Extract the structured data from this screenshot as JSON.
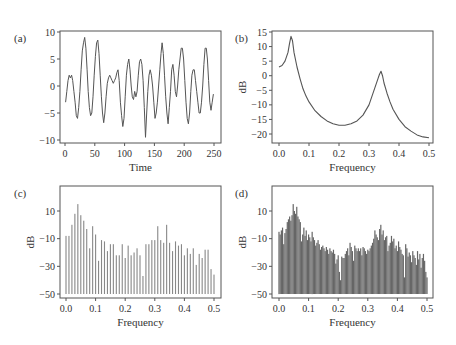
{
  "figure": {
    "panels": [
      "(a)",
      "(b)",
      "(c)",
      "(d)"
    ]
  },
  "chart_data": [
    {
      "id": "a",
      "panel_label": "(a)",
      "type": "line",
      "title": "",
      "xlabel": "Time",
      "ylabel": "",
      "xlim": [
        0,
        250
      ],
      "ylim": [
        -10,
        10
      ],
      "xticks": [
        0,
        50,
        100,
        150,
        200,
        250
      ],
      "yticks": [
        -10,
        -5,
        0,
        5,
        10
      ],
      "xtick_labels": [
        "0",
        "50",
        "100",
        "150",
        "200",
        "250"
      ],
      "ytick_labels": [
        "−10",
        "−5",
        "0",
        "5",
        "10"
      ],
      "x": [
        1,
        3,
        5,
        7,
        9,
        11,
        13,
        15,
        17,
        19,
        21,
        23,
        25,
        27,
        29,
        31,
        33,
        35,
        37,
        39,
        41,
        43,
        45,
        47,
        49,
        51,
        53,
        55,
        57,
        59,
        61,
        63,
        65,
        67,
        69,
        71,
        73,
        75,
        77,
        79,
        81,
        83,
        85,
        87,
        89,
        91,
        93,
        95,
        97,
        99,
        101,
        103,
        105,
        107,
        109,
        111,
        113,
        115,
        117,
        119,
        121,
        123,
        125,
        127,
        129,
        131,
        133,
        135,
        137,
        139,
        141,
        143,
        145,
        147,
        149,
        151,
        153,
        155,
        157,
        159,
        161,
        163,
        165,
        167,
        169,
        171,
        173,
        175,
        177,
        179,
        181,
        183,
        185,
        187,
        189,
        191,
        193,
        195,
        197,
        199,
        201,
        203,
        205,
        207,
        209,
        211,
        213,
        215,
        217,
        219,
        221,
        223,
        225,
        227,
        229,
        231,
        233,
        235,
        237,
        239,
        241,
        243,
        245,
        247,
        249
      ],
      "values": [
        -3,
        -1,
        1,
        2,
        1.5,
        2,
        1,
        -1,
        -3,
        -5.5,
        -6,
        -4,
        -1,
        3,
        6.5,
        8,
        9,
        7,
        3,
        -1,
        -4,
        -5.5,
        -5,
        -2,
        2,
        5.5,
        8,
        8.5,
        6,
        2,
        -2,
        -5,
        -6.8,
        -5,
        -2,
        0.5,
        1.5,
        2,
        1.5,
        1,
        0.5,
        1,
        1.5,
        2.5,
        3,
        1,
        -3,
        -5.5,
        -7.5,
        -6,
        -2,
        2,
        4,
        5,
        3,
        0,
        -2,
        -2.5,
        -1,
        -2,
        -1,
        2,
        4.5,
        5,
        4,
        1,
        -4,
        -9.5,
        -5,
        -1,
        2,
        3,
        2,
        0,
        -3,
        -6,
        -5,
        -3,
        0,
        3,
        6,
        8,
        6,
        2,
        -2,
        -5,
        -7,
        -4,
        -1,
        3,
        4,
        2,
        -1,
        -2,
        0,
        3,
        5,
        7,
        7,
        5,
        1,
        -3,
        -6,
        -7,
        -5,
        -1,
        2,
        3,
        3,
        1,
        -1,
        -3,
        -5,
        -5,
        -3,
        0,
        4,
        7,
        7,
        5,
        1,
        -3,
        -4.5,
        -3,
        -1.5,
        -1.5,
        -1.5
      ],
      "line_color": "#555555"
    },
    {
      "id": "b",
      "panel_label": "(b)",
      "type": "line",
      "title": "",
      "xlabel": "Frequency",
      "ylabel": "dB",
      "xlim": [
        0,
        0.5
      ],
      "ylim": [
        -22,
        15
      ],
      "xticks": [
        0.0,
        0.1,
        0.2,
        0.3,
        0.4,
        0.5
      ],
      "yticks": [
        -20,
        -15,
        -10,
        -5,
        0,
        5,
        10,
        15
      ],
      "xtick_labels": [
        "0.0",
        "0.1",
        "0.2",
        "0.3",
        "0.4",
        "0.5"
      ],
      "ytick_labels": [
        "−20",
        "−15",
        "−10",
        "−5",
        "0",
        "5",
        "10",
        "15"
      ],
      "x": [
        0.0,
        0.01,
        0.02,
        0.03,
        0.035,
        0.04,
        0.045,
        0.05,
        0.06,
        0.07,
        0.08,
        0.09,
        0.1,
        0.12,
        0.14,
        0.16,
        0.18,
        0.2,
        0.22,
        0.24,
        0.26,
        0.28,
        0.3,
        0.31,
        0.32,
        0.33,
        0.335,
        0.34,
        0.345,
        0.35,
        0.36,
        0.37,
        0.38,
        0.4,
        0.42,
        0.44,
        0.46,
        0.48,
        0.5
      ],
      "values": [
        3,
        3.5,
        5,
        8,
        11,
        13.5,
        12,
        8,
        3,
        -1,
        -4.5,
        -7,
        -9,
        -12,
        -14,
        -15.5,
        -16.5,
        -17,
        -17,
        -16.5,
        -15.5,
        -13.5,
        -10,
        -7,
        -4,
        -1,
        0.5,
        1.5,
        0,
        -2.5,
        -6,
        -9,
        -11.5,
        -15,
        -17.5,
        -19,
        -20.3,
        -21,
        -21.3
      ],
      "line_color": "#555555"
    },
    {
      "id": "c",
      "panel_label": "(c)",
      "type": "bar",
      "title": "",
      "xlabel": "Frequency",
      "ylabel": "dB",
      "xlim": [
        0,
        0.5
      ],
      "ylim": [
        -52,
        28
      ],
      "baseline": -50,
      "xticks": [
        0.0,
        0.1,
        0.2,
        0.3,
        0.4,
        0.5
      ],
      "yticks": [
        -50,
        -30,
        -10,
        10
      ],
      "xtick_labels": [
        "0.0",
        "0.1",
        "0.2",
        "0.3",
        "0.4",
        "0.5"
      ],
      "ytick_labels": [
        "−50",
        "−30",
        "−10",
        "10"
      ],
      "values": [
        -8,
        -8,
        0,
        8,
        15,
        7,
        3,
        -3,
        -17,
        -1,
        -7,
        -26,
        -11,
        -12,
        -19,
        -14,
        -14,
        -22,
        -22,
        -14,
        -24,
        -15,
        -22,
        -20,
        -17,
        -22,
        -37,
        -14,
        -14,
        -11,
        -11,
        -1,
        -11,
        -13,
        0,
        -13,
        -19,
        -12,
        -15,
        -14,
        -22,
        -17,
        -21,
        -17,
        -29,
        -21,
        -24,
        -18,
        -18,
        -32,
        -36
      ],
      "bar_color": "#888888"
    },
    {
      "id": "d",
      "panel_label": "(d)",
      "type": "bar",
      "title": "",
      "xlabel": "Frequency",
      "ylabel": "dB",
      "xlim": [
        0,
        0.5
      ],
      "ylim": [
        -52,
        28
      ],
      "baseline": -50,
      "xticks": [
        0.0,
        0.1,
        0.2,
        0.3,
        0.4,
        0.5
      ],
      "yticks": [
        -50,
        -30,
        -10,
        10
      ],
      "xtick_labels": [
        "0.0",
        "0.1",
        "0.2",
        "0.3",
        "0.4",
        "0.5"
      ],
      "ytick_labels": [
        "−50",
        "−30",
        "−10",
        "10"
      ],
      "values": [
        -5,
        -7,
        -4,
        -2,
        -14,
        -6,
        -3,
        2,
        4,
        6,
        3,
        7,
        15,
        10,
        8,
        13,
        6,
        4,
        2,
        -12,
        -7,
        -2,
        -8,
        -4,
        -11,
        -7,
        -9,
        -12,
        -5,
        -9,
        -11,
        -15,
        -13,
        -11,
        -14,
        -18,
        -16,
        -15,
        -17,
        -19,
        -16,
        -18,
        -21,
        -17,
        -19,
        -20,
        -18,
        -21,
        -28,
        -25,
        -22,
        -34,
        -40,
        -23,
        -24,
        -24,
        -21,
        -19,
        -17,
        -22,
        -13,
        -16,
        -19,
        -26,
        -15,
        -17,
        -19,
        -17,
        -19,
        -17,
        -22,
        -16,
        -17,
        -19,
        -21,
        -18,
        -19,
        -17,
        -15,
        -13,
        -10,
        -4,
        -7,
        -9,
        -11,
        -3,
        0,
        -7,
        -4,
        -11,
        -9,
        -8,
        -19,
        -15,
        -13,
        -8,
        -12,
        -10,
        -17,
        -15,
        -19,
        -12,
        -16,
        -18,
        -21,
        -22,
        -38,
        -14,
        -17,
        -23,
        -20,
        -22,
        -27,
        -19,
        -22,
        -24,
        -29,
        -19,
        -25,
        -21,
        -31,
        -24,
        -21,
        -26,
        -34,
        -38
      ],
      "bar_color": "#666666"
    }
  ]
}
